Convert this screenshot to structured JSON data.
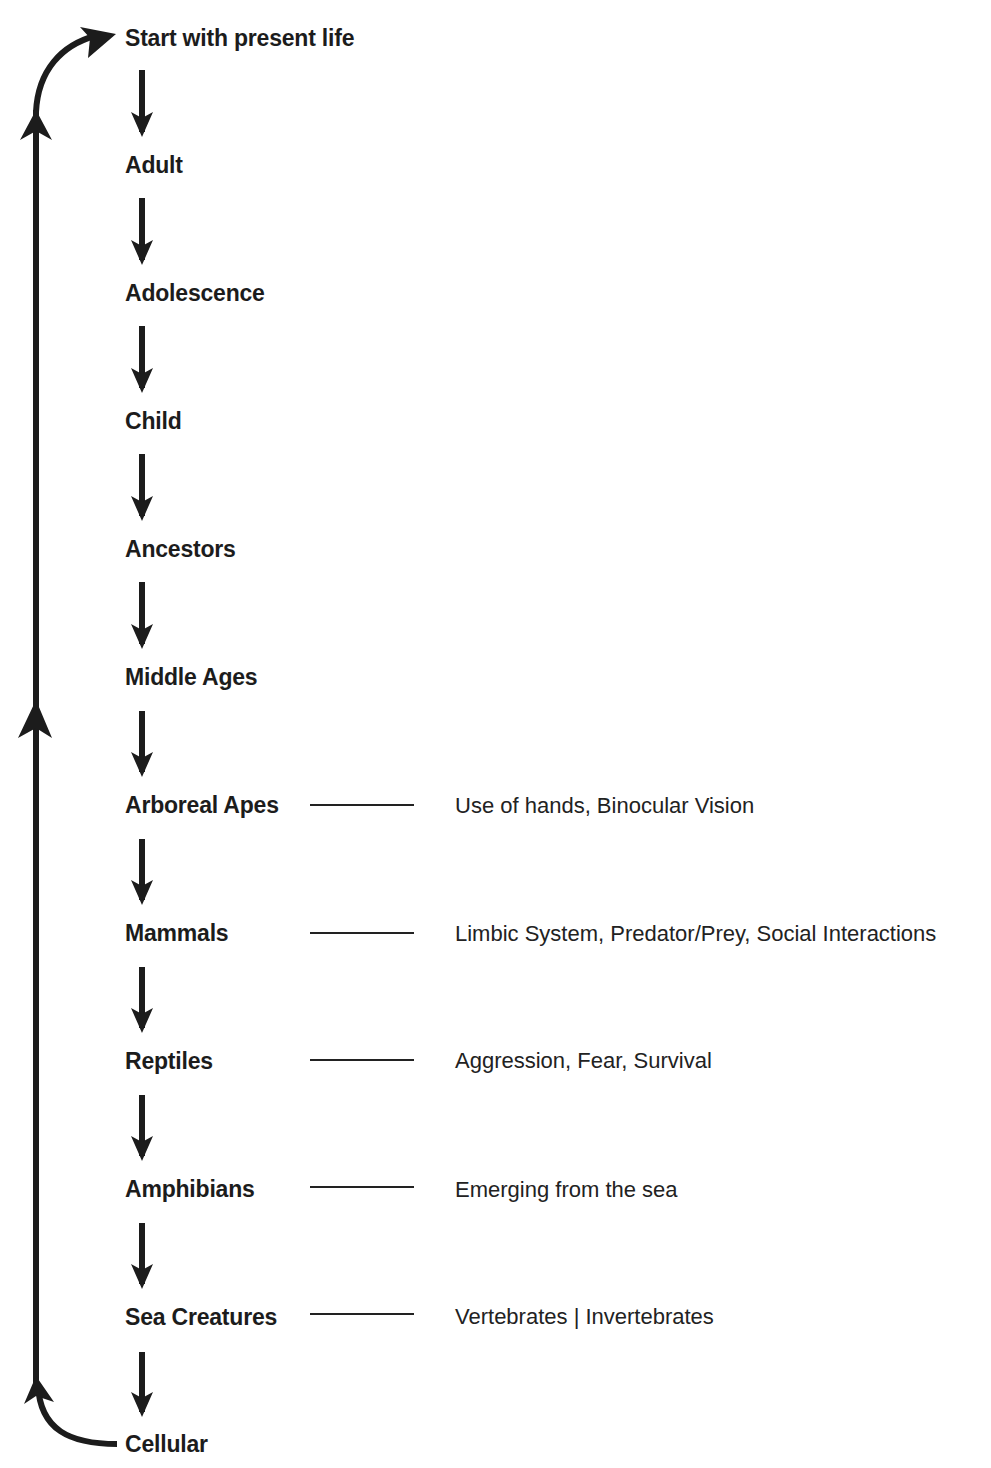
{
  "diagram": {
    "stages": [
      {
        "label": "Start with present life",
        "y": 24,
        "trait": null
      },
      {
        "label": "Adult",
        "y": 151,
        "trait": null
      },
      {
        "label": "Adolescence",
        "y": 279,
        "trait": null
      },
      {
        "label": "Child",
        "y": 407,
        "trait": null
      },
      {
        "label": "Ancestors",
        "y": 535,
        "trait": null
      },
      {
        "label": "Middle Ages",
        "y": 663,
        "trait": null
      },
      {
        "label": "Arboreal Apes",
        "y": 791,
        "trait": "Use of hands, Binocular Vision"
      },
      {
        "label": "Mammals",
        "y": 919,
        "trait": "Limbic System, Predator/Prey, Social Interactions"
      },
      {
        "label": "Reptiles",
        "y": 1047,
        "trait": "Aggression, Fear, Survival"
      },
      {
        "label": "Amphibians",
        "y": 1175,
        "trait": "Emerging from the sea"
      },
      {
        "label": "Sea Creatures",
        "y": 1303,
        "trait": "Vertebrates | Invertebrates"
      },
      {
        "label": "Cellular",
        "y": 1430,
        "trait": null
      }
    ],
    "arrows": {
      "down_arrow_x": 142,
      "cycle_line_x": 36,
      "direction_sequence": "top-to-bottom",
      "cycle_direction": "bottom-to-top (Cellular back to Start with present life)"
    },
    "colors": {
      "ink": "#1c1c1c",
      "background": "#ffffff"
    }
  }
}
